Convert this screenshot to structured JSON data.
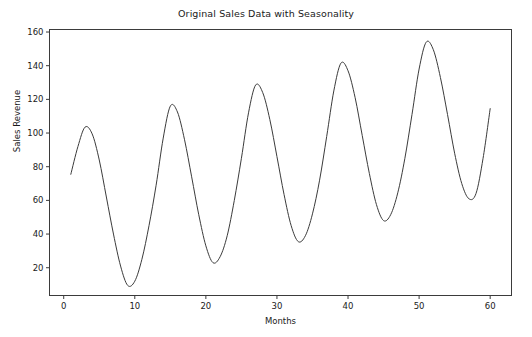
{
  "chart_data": {
    "type": "line",
    "title": "Original Sales Data with Seasonality",
    "xlabel": "Months",
    "ylabel": "Sales Revenue",
    "xlim": [
      -2.0,
      63.0
    ],
    "ylim": [
      3.5,
      161.5
    ],
    "xticks": [
      0,
      10,
      20,
      30,
      40,
      50,
      60
    ],
    "yticks": [
      20,
      40,
      60,
      80,
      100,
      120,
      140,
      160
    ],
    "grid": false,
    "legend": null,
    "line_color": "#3b3b3b",
    "line_width": 1.0,
    "series": [
      {
        "name": "Sales Revenue",
        "x": [
          1,
          2,
          3,
          4,
          5,
          6,
          7,
          8,
          9,
          10,
          11,
          12,
          13,
          14,
          15,
          16,
          17,
          18,
          19,
          20,
          21,
          22,
          23,
          24,
          25,
          26,
          27,
          28,
          29,
          30,
          31,
          32,
          33,
          34,
          35,
          36,
          37,
          38,
          39,
          40,
          41,
          42,
          43,
          44,
          45,
          46,
          47,
          48,
          49,
          50,
          51,
          52,
          53,
          54,
          55,
          56,
          57,
          58,
          59,
          60
        ],
        "values": [
          75.5,
          92.0,
          103.5,
          99.5,
          84.0,
          62.0,
          40.0,
          21.0,
          9.5,
          12.0,
          25.0,
          45.0,
          69.0,
          97.0,
          116.0,
          112.5,
          96.0,
          74.0,
          51.5,
          33.0,
          23.0,
          26.5,
          39.0,
          60.0,
          85.0,
          112.0,
          128.5,
          124.0,
          108.0,
          86.0,
          63.5,
          45.0,
          35.5,
          39.0,
          52.0,
          72.0,
          98.0,
          125.0,
          141.5,
          137.0,
          121.0,
          98.5,
          76.0,
          57.5,
          48.0,
          51.5,
          64.5,
          85.0,
          111.0,
          138.0,
          154.0,
          149.5,
          133.0,
          111.0,
          88.0,
          70.0,
          61.0,
          64.0,
          85.0,
          114.5
        ]
      }
    ],
    "peaks": [
      {
        "x": 3,
        "y": 103.5
      },
      {
        "x": 15,
        "y": 116.0
      },
      {
        "x": 27,
        "y": 128.5
      },
      {
        "x": 39,
        "y": 141.5
      },
      {
        "x": 51,
        "y": 154.0
      }
    ],
    "troughs": [
      {
        "x": 9,
        "y": 9.5
      },
      {
        "x": 21,
        "y": 23.0
      },
      {
        "x": 33,
        "y": 35.5
      },
      {
        "x": 45,
        "y": 48.0
      },
      {
        "x": 57,
        "y": 61.0
      }
    ]
  }
}
